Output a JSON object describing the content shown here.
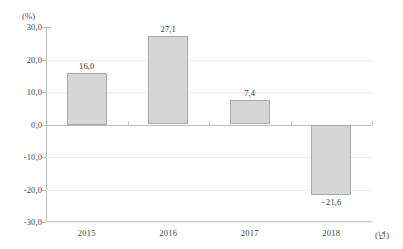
{
  "chart_data": {
    "type": "bar",
    "title": "",
    "categories": [
      "2015",
      "2016",
      "2017",
      "2018"
    ],
    "values": [
      16.0,
      27.1,
      7.4,
      -21.6
    ],
    "value_labels": [
      "16,0",
      "27,1",
      "7,4",
      "−21,6"
    ],
    "xlabel": "(년)",
    "ylabel": "(%)",
    "ylim": [
      -30.0,
      30.0
    ],
    "ytick_values": [
      30.0,
      20.0,
      10.0,
      0.0,
      -10.0,
      -20.0,
      -30.0
    ],
    "ytick_labels": [
      "30,0",
      "20,0",
      "10,0",
      "0,0",
      "-10,0",
      "-20,0",
      "-30,0"
    ],
    "grid": true,
    "legend": null,
    "bar_fill_color": "#d6d6d6",
    "bar_border_color": "#a8a8a8",
    "gridline_color": "#ececed",
    "axis_color": "#b9b9b9"
  }
}
